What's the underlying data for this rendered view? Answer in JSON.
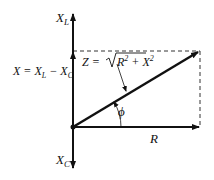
{
  "diagram": {
    "labels": {
      "xl_main": "X",
      "xl_sub": "L",
      "xc_main": "X",
      "xc_sub": "C",
      "x_eq_lhs": "X = X",
      "x_eq_sub1": "L",
      "x_eq_mid": " − X",
      "x_eq_sub2": "C",
      "z_eq_lhs": "Z = ",
      "z_eq_r": "R",
      "z_eq_r_exp": "2",
      "z_eq_plus": " + X",
      "z_eq_x_exp": "2",
      "phi": "ϕ",
      "r": "R"
    },
    "vectors": [
      {
        "name": "XL-axis",
        "from": [
          73,
          127
        ],
        "to": [
          73,
          14
        ]
      },
      {
        "name": "XC-axis",
        "from": [
          73,
          127
        ],
        "to": [
          73,
          168
        ]
      },
      {
        "name": "X",
        "from": [
          73,
          127
        ],
        "to": [
          73,
          51
        ]
      },
      {
        "name": "R",
        "from": [
          73,
          127
        ],
        "to": [
          199,
          127
        ]
      },
      {
        "name": "Z",
        "from": [
          73,
          127
        ],
        "to": [
          199,
          51
        ]
      }
    ],
    "colors": {
      "line": "#111111",
      "background": "#ffffff"
    }
  }
}
